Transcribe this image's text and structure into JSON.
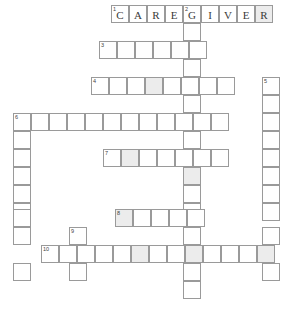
{
  "puzzle": {
    "title": "Crossword Puzzle Grid",
    "cell_size": 18,
    "border_color": "#9a9a9a",
    "shaded_color": "#ececec",
    "background_color": "#ffffff",
    "entries": [
      {
        "number": "1",
        "direction": "across",
        "answer": "CAREGIVER",
        "length": 9,
        "start": {
          "col": 6,
          "row": 0
        },
        "letters": [
          "C",
          "A",
          "R",
          "E",
          "G",
          "I",
          "V",
          "E",
          "R"
        ]
      },
      {
        "number": "2",
        "direction": "down",
        "answer": "",
        "length": 16,
        "start": {
          "col": 10,
          "row": 0
        },
        "letters": []
      },
      {
        "number": "3",
        "direction": "across",
        "answer": "",
        "length": 6,
        "start": {
          "col": 5,
          "row": 2
        },
        "letters": []
      },
      {
        "number": "4",
        "direction": "across",
        "answer": "",
        "length": 10,
        "start": {
          "col": 5,
          "row": 4
        },
        "letters": []
      },
      {
        "number": "5",
        "direction": "down",
        "answer": "",
        "length": 10,
        "start": {
          "col": 15,
          "row": 4
        },
        "letters": []
      },
      {
        "number": "6",
        "direction": "across",
        "answer": "",
        "length": 12,
        "start": {
          "col": 0,
          "row": 6
        },
        "letters": []
      },
      {
        "number": "7",
        "direction": "across",
        "answer": "",
        "length": 7,
        "start": {
          "col": 5,
          "row": 8
        },
        "letters": []
      },
      {
        "number": "8",
        "direction": "across",
        "answer": "",
        "length": 5,
        "start": {
          "col": 6,
          "row": 11
        },
        "letters": []
      },
      {
        "number": "9",
        "direction": "down",
        "answer": "",
        "length": 4,
        "start": {
          "col": 2,
          "row": 12
        },
        "letters": []
      },
      {
        "number": "10",
        "direction": "across",
        "answer": "",
        "length": 13,
        "start": {
          "col": 0,
          "row": 13
        },
        "letters": []
      }
    ],
    "cells": [
      {
        "x": 111,
        "y": 5,
        "num": "1",
        "letter": "C",
        "shaded": false
      },
      {
        "x": 129,
        "y": 5,
        "num": "",
        "letter": "A",
        "shaded": false
      },
      {
        "x": 147,
        "y": 5,
        "num": "",
        "letter": "R",
        "shaded": false
      },
      {
        "x": 165,
        "y": 5,
        "num": "",
        "letter": "E",
        "shaded": false
      },
      {
        "x": 183,
        "y": 5,
        "num": "2",
        "letter": "G",
        "shaded": false
      },
      {
        "x": 201,
        "y": 5,
        "num": "",
        "letter": "I",
        "shaded": false
      },
      {
        "x": 219,
        "y": 5,
        "num": "",
        "letter": "V",
        "shaded": false
      },
      {
        "x": 237,
        "y": 5,
        "num": "",
        "letter": "E",
        "shaded": false
      },
      {
        "x": 255,
        "y": 5,
        "num": "",
        "letter": "R",
        "shaded": true
      },
      {
        "x": 183,
        "y": 23,
        "num": "",
        "letter": "",
        "shaded": false
      },
      {
        "x": 99,
        "y": 41,
        "num": "3",
        "letter": "",
        "shaded": false
      },
      {
        "x": 117,
        "y": 41,
        "num": "",
        "letter": "",
        "shaded": false
      },
      {
        "x": 135,
        "y": 41,
        "num": "",
        "letter": "",
        "shaded": false
      },
      {
        "x": 153,
        "y": 41,
        "num": "",
        "letter": "",
        "shaded": false
      },
      {
        "x": 171,
        "y": 41,
        "num": "",
        "letter": "",
        "shaded": false
      },
      {
        "x": 189,
        "y": 41,
        "num": "",
        "letter": "",
        "shaded": false
      },
      {
        "x": 183,
        "y": 59,
        "num": "",
        "letter": "",
        "shaded": false
      },
      {
        "x": 91,
        "y": 77,
        "num": "4",
        "letter": "",
        "shaded": false
      },
      {
        "x": 109,
        "y": 77,
        "num": "",
        "letter": "",
        "shaded": false
      },
      {
        "x": 127,
        "y": 77,
        "num": "",
        "letter": "",
        "shaded": false
      },
      {
        "x": 145,
        "y": 77,
        "num": "",
        "letter": "",
        "shaded": true
      },
      {
        "x": 163,
        "y": 77,
        "num": "",
        "letter": "",
        "shaded": false
      },
      {
        "x": 181,
        "y": 77,
        "num": "",
        "letter": "",
        "shaded": false
      },
      {
        "x": 199,
        "y": 77,
        "num": "",
        "letter": "",
        "shaded": false
      },
      {
        "x": 217,
        "y": 77,
        "num": "",
        "letter": "",
        "shaded": false
      },
      {
        "x": 262,
        "y": 77,
        "num": "5",
        "letter": "",
        "shaded": false
      },
      {
        "x": 183,
        "y": 95,
        "num": "",
        "letter": "",
        "shaded": false
      },
      {
        "x": 262,
        "y": 95,
        "num": "",
        "letter": "",
        "shaded": false
      },
      {
        "x": 13,
        "y": 113,
        "num": "6",
        "letter": "",
        "shaded": false
      },
      {
        "x": 31,
        "y": 113,
        "num": "",
        "letter": "",
        "shaded": false
      },
      {
        "x": 49,
        "y": 113,
        "num": "",
        "letter": "",
        "shaded": false
      },
      {
        "x": 67,
        "y": 113,
        "num": "",
        "letter": "",
        "shaded": false
      },
      {
        "x": 85,
        "y": 113,
        "num": "",
        "letter": "",
        "shaded": false
      },
      {
        "x": 103,
        "y": 113,
        "num": "",
        "letter": "",
        "shaded": false
      },
      {
        "x": 121,
        "y": 113,
        "num": "",
        "letter": "",
        "shaded": false
      },
      {
        "x": 139,
        "y": 113,
        "num": "",
        "letter": "",
        "shaded": false
      },
      {
        "x": 157,
        "y": 113,
        "num": "",
        "letter": "",
        "shaded": false
      },
      {
        "x": 175,
        "y": 113,
        "num": "",
        "letter": "",
        "shaded": false
      },
      {
        "x": 193,
        "y": 113,
        "num": "",
        "letter": "",
        "shaded": false
      },
      {
        "x": 211,
        "y": 113,
        "num": "",
        "letter": "",
        "shaded": false
      },
      {
        "x": 262,
        "y": 113,
        "num": "",
        "letter": "",
        "shaded": false
      },
      {
        "x": 13,
        "y": 131,
        "num": "",
        "letter": "",
        "shaded": false
      },
      {
        "x": 183,
        "y": 131,
        "num": "",
        "letter": "",
        "shaded": false
      },
      {
        "x": 262,
        "y": 131,
        "num": "",
        "letter": "",
        "shaded": false
      },
      {
        "x": 13,
        "y": 149,
        "num": "",
        "letter": "",
        "shaded": false
      },
      {
        "x": 103,
        "y": 149,
        "num": "7",
        "letter": "",
        "shaded": false
      },
      {
        "x": 121,
        "y": 149,
        "num": "",
        "letter": "",
        "shaded": true
      },
      {
        "x": 139,
        "y": 149,
        "num": "",
        "letter": "",
        "shaded": false
      },
      {
        "x": 157,
        "y": 149,
        "num": "",
        "letter": "",
        "shaded": false
      },
      {
        "x": 175,
        "y": 149,
        "num": "",
        "letter": "",
        "shaded": false
      },
      {
        "x": 193,
        "y": 149,
        "num": "",
        "letter": "",
        "shaded": false
      },
      {
        "x": 211,
        "y": 149,
        "num": "",
        "letter": "",
        "shaded": false
      },
      {
        "x": 262,
        "y": 149,
        "num": "",
        "letter": "",
        "shaded": false
      },
      {
        "x": 13,
        "y": 167,
        "num": "",
        "letter": "",
        "shaded": false
      },
      {
        "x": 183,
        "y": 167,
        "num": "",
        "letter": "",
        "shaded": true
      },
      {
        "x": 262,
        "y": 167,
        "num": "",
        "letter": "",
        "shaded": false
      },
      {
        "x": 13,
        "y": 185,
        "num": "",
        "letter": "",
        "shaded": false
      },
      {
        "x": 183,
        "y": 185,
        "num": "",
        "letter": "",
        "shaded": false
      },
      {
        "x": 262,
        "y": 185,
        "num": "",
        "letter": "",
        "shaded": false
      },
      {
        "x": 13,
        "y": 203,
        "num": "",
        "letter": "",
        "shaded": false
      },
      {
        "x": 183,
        "y": 203,
        "num": "",
        "letter": "",
        "shaded": false
      },
      {
        "x": 262,
        "y": 203,
        "num": "",
        "letter": "",
        "shaded": false
      },
      {
        "x": 13,
        "y": 209,
        "num": "",
        "letter": "",
        "shaded": false
      },
      {
        "x": 115,
        "y": 209,
        "num": "8",
        "letter": "",
        "shaded": true
      },
      {
        "x": 133,
        "y": 209,
        "num": "",
        "letter": "",
        "shaded": false
      },
      {
        "x": 151,
        "y": 209,
        "num": "",
        "letter": "",
        "shaded": false
      },
      {
        "x": 169,
        "y": 209,
        "num": "",
        "letter": "",
        "shaded": false
      },
      {
        "x": 187,
        "y": 209,
        "num": "",
        "letter": "",
        "shaded": false
      },
      {
        "x": 13,
        "y": 227,
        "num": "",
        "letter": "",
        "shaded": false
      },
      {
        "x": 69,
        "y": 227,
        "num": "9",
        "letter": "",
        "shaded": false
      },
      {
        "x": 183,
        "y": 227,
        "num": "",
        "letter": "",
        "shaded": false
      },
      {
        "x": 262,
        "y": 227,
        "num": "",
        "letter": "",
        "shaded": false
      },
      {
        "x": 41,
        "y": 245,
        "num": "10",
        "letter": "",
        "shaded": false
      },
      {
        "x": 59,
        "y": 245,
        "num": "",
        "letter": "",
        "shaded": false
      },
      {
        "x": 77,
        "y": 245,
        "num": "",
        "letter": "",
        "shaded": false
      },
      {
        "x": 95,
        "y": 245,
        "num": "",
        "letter": "",
        "shaded": false
      },
      {
        "x": 113,
        "y": 245,
        "num": "",
        "letter": "",
        "shaded": false
      },
      {
        "x": 131,
        "y": 245,
        "num": "",
        "letter": "",
        "shaded": true
      },
      {
        "x": 149,
        "y": 245,
        "num": "",
        "letter": "",
        "shaded": false
      },
      {
        "x": 167,
        "y": 245,
        "num": "",
        "letter": "",
        "shaded": false
      },
      {
        "x": 185,
        "y": 245,
        "num": "",
        "letter": "",
        "shaded": true
      },
      {
        "x": 203,
        "y": 245,
        "num": "",
        "letter": "",
        "shaded": false
      },
      {
        "x": 221,
        "y": 245,
        "num": "",
        "letter": "",
        "shaded": false
      },
      {
        "x": 239,
        "y": 245,
        "num": "",
        "letter": "",
        "shaded": false
      },
      {
        "x": 257,
        "y": 245,
        "num": "",
        "letter": "",
        "shaded": true
      },
      {
        "x": 13,
        "y": 263,
        "num": "",
        "letter": "",
        "shaded": false
      },
      {
        "x": 69,
        "y": 263,
        "num": "",
        "letter": "",
        "shaded": false
      },
      {
        "x": 183,
        "y": 263,
        "num": "",
        "letter": "",
        "shaded": false
      },
      {
        "x": 262,
        "y": 263,
        "num": "",
        "letter": "",
        "shaded": false
      },
      {
        "x": 183,
        "y": 281,
        "num": "",
        "letter": "",
        "shaded": false
      }
    ]
  }
}
